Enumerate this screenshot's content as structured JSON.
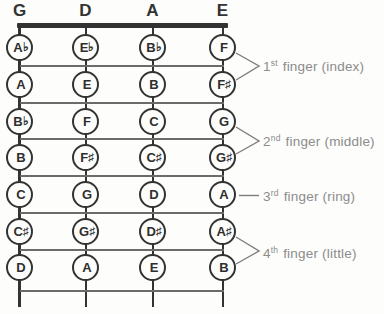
{
  "diagram": "violin-first-position-fingering-chart",
  "colors": {
    "ink": "#333333",
    "fret_line": "#6b6b6b",
    "annotation_text": "#8c8c8c",
    "background": "#fdfdfb"
  },
  "strings": [
    {
      "label": "G",
      "notes": [
        {
          "l": "A",
          "a": "♭"
        },
        {
          "l": "A",
          "a": ""
        },
        {
          "l": "B",
          "a": "♭"
        },
        {
          "l": "B",
          "a": ""
        },
        {
          "l": "C",
          "a": ""
        },
        {
          "l": "C",
          "a": "♯"
        },
        {
          "l": "D",
          "a": ""
        }
      ]
    },
    {
      "label": "D",
      "notes": [
        {
          "l": "E",
          "a": "♭"
        },
        {
          "l": "E",
          "a": ""
        },
        {
          "l": "F",
          "a": ""
        },
        {
          "l": "F",
          "a": "♯"
        },
        {
          "l": "G",
          "a": ""
        },
        {
          "l": "G",
          "a": "♯"
        },
        {
          "l": "A",
          "a": ""
        }
      ]
    },
    {
      "label": "A",
      "notes": [
        {
          "l": "B",
          "a": "♭"
        },
        {
          "l": "B",
          "a": ""
        },
        {
          "l": "C",
          "a": ""
        },
        {
          "l": "C",
          "a": "♯"
        },
        {
          "l": "D",
          "a": ""
        },
        {
          "l": "D",
          "a": "♯"
        },
        {
          "l": "E",
          "a": ""
        }
      ]
    },
    {
      "label": "E",
      "notes": [
        {
          "l": "F",
          "a": ""
        },
        {
          "l": "F",
          "a": "♯"
        },
        {
          "l": "G",
          "a": ""
        },
        {
          "l": "G",
          "a": "♯"
        },
        {
          "l": "A",
          "a": ""
        },
        {
          "l": "A",
          "a": "♯"
        },
        {
          "l": "B",
          "a": ""
        }
      ]
    }
  ],
  "fingers": [
    {
      "ordinal": "1",
      "suffix": "st",
      "rest": " finger (index)"
    },
    {
      "ordinal": "2",
      "suffix": "nd",
      "rest": " finger (middle)"
    },
    {
      "ordinal": "3",
      "suffix": "rd",
      "rest": " finger (ring)"
    },
    {
      "ordinal": "4",
      "suffix": "th",
      "rest": " finger (little)"
    }
  ]
}
